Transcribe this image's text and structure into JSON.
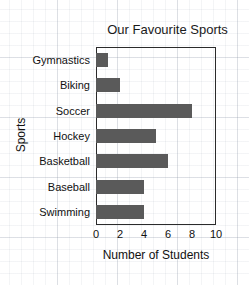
{
  "chart_data": {
    "type": "bar",
    "orientation": "horizontal",
    "title": "Our Favourite Sports",
    "xlabel": "Number of Students",
    "ylabel": "Sports",
    "categories": [
      "Gymnastics",
      "Biking",
      "Soccer",
      "Hockey",
      "Basketball",
      "Baseball",
      "Swimming"
    ],
    "values": [
      1,
      2,
      8,
      5,
      6,
      4,
      4
    ],
    "xlim": [
      0,
      10
    ],
    "xticks": [
      0,
      2,
      4,
      6,
      8,
      10
    ],
    "xtick_labels": [
      "0",
      "2",
      "4",
      "6",
      "8",
      "10"
    ],
    "grid": false,
    "legend": null,
    "bar_color": "#5a5a5a",
    "axis_color": "#2b2b2b",
    "background": "#ffffff",
    "paper_grid_color": "#8c96a5"
  }
}
